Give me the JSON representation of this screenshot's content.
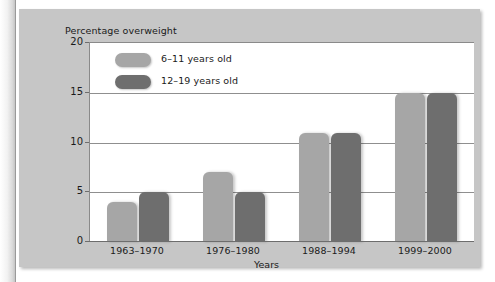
{
  "chart_data": {
    "type": "bar",
    "title": "Percentage overweight",
    "xlabel": "Years",
    "ylabel": "Percentage overweight",
    "categories": [
      "1963–1970",
      "1976–1980",
      "1988–1994",
      "1999–2000"
    ],
    "series": [
      {
        "name": "6–11 years old",
        "values": [
          4,
          7,
          11,
          15
        ],
        "color": "#a6a6a6"
      },
      {
        "name": "12–19 years old",
        "values": [
          5,
          5,
          11,
          15
        ],
        "color": "#6e6e6e"
      }
    ],
    "ylim": [
      0,
      20
    ],
    "yticks": [
      0,
      5,
      10,
      15,
      20
    ],
    "ytick_labels": [
      "0",
      "5",
      "10",
      "15",
      "20"
    ],
    "grid": true,
    "legend_position": "top-left-inside"
  },
  "colors": {
    "panel_background": "#c6c6c6",
    "plot_background": "#ffffff",
    "gridline": "#8f8f8f",
    "axis": "#6d6d6d",
    "text": "#1a1a1a",
    "series_light": "#a6a6a6",
    "series_dark": "#6e6e6e"
  }
}
